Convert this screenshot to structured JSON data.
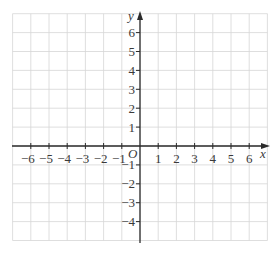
{
  "diagram": {
    "type": "coordinate-grid",
    "x_axis": {
      "label": "x",
      "min": -7,
      "max": 7,
      "tick_labels": [
        "-6",
        "-5",
        "-4",
        "-3",
        "-2",
        "-1",
        "1",
        "2",
        "3",
        "4",
        "5",
        "6"
      ]
    },
    "y_axis": {
      "label": "y",
      "min": -5,
      "max": 7,
      "tick_labels": [
        "6",
        "5",
        "4",
        "3",
        "2",
        "1",
        "-1",
        "-2",
        "-3",
        "-4"
      ]
    },
    "origin_label": "O",
    "colors": {
      "grid": "#d6d6d6",
      "axis": "#2b2b2b",
      "text": "#3a3a3a"
    }
  }
}
